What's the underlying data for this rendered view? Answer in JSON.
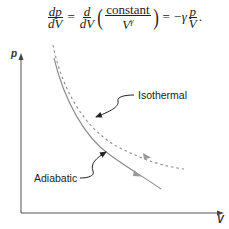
{
  "equation": {
    "lhs_num": "dp",
    "lhs_den": "dV",
    "eq1": "=",
    "d_num": "d",
    "d_den": "dV",
    "const_num": "constant",
    "const_den": "V",
    "gamma_sup": "γ",
    "eq2": "=",
    "neg_gamma": "−γ",
    "rhs_num": "p",
    "rhs_den": "V",
    "period": "."
  },
  "axes": {
    "y_label": "p",
    "x_label": "V"
  },
  "curves": {
    "isothermal": {
      "label": "Isothermal",
      "style": "dashed",
      "color": "#8a8a8a"
    },
    "adiabatic": {
      "label": "Adiabatic",
      "style": "solid",
      "color": "#8a8a8a"
    }
  },
  "colors": {
    "axis": "#555555",
    "text": "#222222",
    "pointer": "#222222"
  }
}
